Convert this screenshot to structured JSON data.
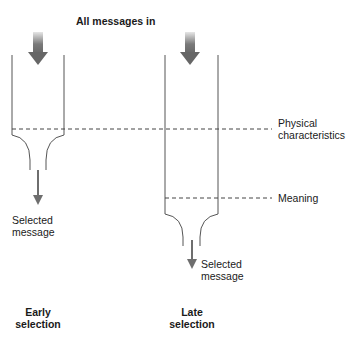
{
  "title": "All messages in",
  "levels": {
    "physical": "Physical characteristics",
    "physical_line1": "Physical",
    "physical_line2": "characteristics",
    "meaning": "Meaning"
  },
  "early": {
    "output_line1": "Selected",
    "output_line2": "message",
    "caption_line1": "Early",
    "caption_line2": "selection"
  },
  "late": {
    "output_line1": "Selected",
    "output_line2": "message",
    "caption_line1": "Late",
    "caption_line2": "selection"
  },
  "colors": {
    "line": "#555555",
    "arrow": "#6e6e6e",
    "arrow_fade": "#d8d8d8",
    "dash": "#444444"
  }
}
